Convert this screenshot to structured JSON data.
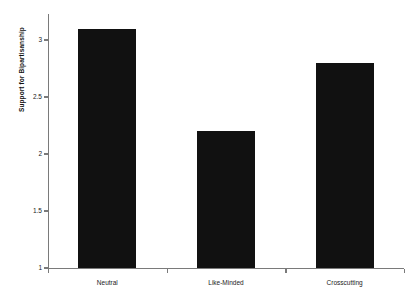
{
  "chart_data": {
    "type": "bar",
    "title": "",
    "subtitle": "",
    "xlabel": "",
    "ylabel": "Support for Bipartisanship",
    "categories": [
      "Neutral",
      "Like-Minded",
      "Crosscutting"
    ],
    "values": [
      3.1,
      2.2,
      2.8
    ],
    "ylim": [
      1,
      3.2
    ],
    "yticks": [
      1,
      1.5,
      2,
      2.5,
      3
    ],
    "ytick_labels": [
      "1",
      "1.5",
      "2",
      "2.5",
      "3"
    ],
    "grid": false,
    "legend": false,
    "legend_position": "none",
    "bar_color": "#111111",
    "axis_color": "#7a7a7a",
    "background_color": "#ffffff"
  }
}
